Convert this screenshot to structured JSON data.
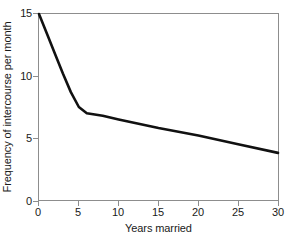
{
  "chart_data": {
    "type": "line",
    "title": "",
    "subtitle": "",
    "xlabel": "Years married",
    "ylabel": "Frequency of intercourse per month",
    "xlim": [
      0,
      30
    ],
    "ylim": [
      0,
      15
    ],
    "xticks": [
      "0",
      "5",
      "10",
      "15",
      "20",
      "25",
      "30"
    ],
    "yticks": [
      "0",
      "5",
      "10",
      "15"
    ],
    "xtick_values": [
      0,
      5,
      10,
      15,
      20,
      25,
      30
    ],
    "ytick_values": [
      0,
      5,
      10,
      15
    ],
    "grid": false,
    "legend": false,
    "legend_position": "none",
    "series": [
      {
        "name": "Frequency of intercourse per month",
        "color": "#111111",
        "line_width": 2.6,
        "x": [
          0,
          1,
          2,
          3,
          4,
          5,
          6,
          8,
          10,
          15,
          20,
          25,
          30
        ],
        "values": [
          15.0,
          13.4,
          11.8,
          10.2,
          8.7,
          7.5,
          7.0,
          6.8,
          6.5,
          5.8,
          5.2,
          4.5,
          3.8
        ]
      }
    ],
    "annotations": []
  },
  "axes": {
    "frame_color": "#8d8d8d",
    "tick_color": "#8d8d8d",
    "text_color": "#1a1a1a",
    "background": "#ffffff"
  }
}
